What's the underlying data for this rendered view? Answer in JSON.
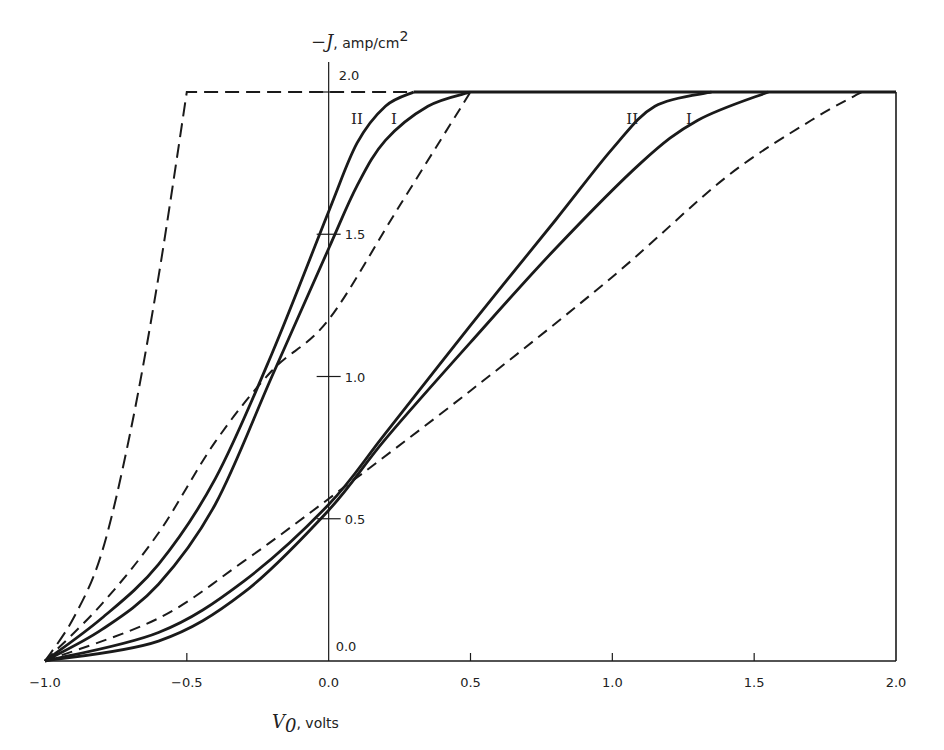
{
  "chart_data": {
    "type": "line",
    "title": "",
    "xlabel": "V0, volts",
    "ylabel": "-J, amp/cm2",
    "xlim": [
      -1.0,
      2.0
    ],
    "ylim": [
      0.0,
      2.0
    ],
    "grid": false,
    "legend": "none (curves labeled inline with I and II)",
    "x_ticks": [
      -1.0,
      -0.5,
      0.0,
      0.5,
      1.0,
      1.5,
      2.0
    ],
    "x_tick_labels": [
      "−1.0",
      "−0.5",
      "0.0",
      "0.5",
      "1.0",
      "1.5",
      "2.0"
    ],
    "y_ticks": [
      0.0,
      0.5,
      1.0,
      1.5,
      2.0
    ],
    "y_tick_labels": [
      "0.0",
      "0.5",
      "1.0",
      "1.5",
      "2.0"
    ],
    "saturation_level": 2.0,
    "series": [
      {
        "name": "left dashed (steep)",
        "style": "dashed",
        "group": "left",
        "x": [
          -1.0,
          -0.9,
          -0.8,
          -0.7,
          -0.6,
          -0.5,
          0.3
        ],
        "y": [
          0.0,
          0.15,
          0.38,
          0.8,
          1.35,
          2.0,
          2.0
        ]
      },
      {
        "name": "left dashed (linear)",
        "style": "dashed",
        "group": "left",
        "x": [
          -1.0,
          -0.8,
          -0.6,
          -0.4,
          -0.2,
          0.0,
          0.25,
          0.5
        ],
        "y": [
          0.0,
          0.2,
          0.45,
          0.77,
          1.02,
          1.2,
          1.6,
          2.0
        ]
      },
      {
        "name": "II",
        "style": "solid",
        "group": "left",
        "x": [
          -1.0,
          -0.8,
          -0.6,
          -0.4,
          -0.2,
          0.0,
          0.1,
          0.2,
          0.3
        ],
        "y": [
          0.0,
          0.15,
          0.34,
          0.64,
          1.08,
          1.58,
          1.82,
          1.95,
          2.0
        ]
      },
      {
        "name": "I",
        "style": "solid",
        "group": "left",
        "x": [
          -1.0,
          -0.8,
          -0.6,
          -0.4,
          -0.2,
          0.0,
          0.1,
          0.2,
          0.35,
          0.5
        ],
        "y": [
          0.0,
          0.11,
          0.27,
          0.55,
          1.0,
          1.45,
          1.67,
          1.83,
          1.95,
          2.0
        ]
      },
      {
        "name": "II",
        "style": "solid",
        "group": "right",
        "x": [
          -1.0,
          -0.6,
          -0.3,
          0.0,
          0.2,
          0.5,
          0.8,
          1.0,
          1.15,
          1.35
        ],
        "y": [
          0.0,
          0.1,
          0.28,
          0.55,
          0.8,
          1.18,
          1.55,
          1.8,
          1.95,
          2.0
        ]
      },
      {
        "name": "I",
        "style": "solid",
        "group": "right",
        "x": [
          -1.0,
          -0.6,
          -0.3,
          0.0,
          0.2,
          0.5,
          0.8,
          1.1,
          1.3,
          1.55
        ],
        "y": [
          0.0,
          0.07,
          0.24,
          0.53,
          0.78,
          1.12,
          1.45,
          1.75,
          1.9,
          2.0
        ]
      },
      {
        "name": "right dashed",
        "style": "dashed",
        "group": "right",
        "x": [
          -1.0,
          -0.6,
          -0.3,
          0.0,
          0.5,
          1.0,
          1.4,
          1.7,
          1.88
        ],
        "y": [
          0.0,
          0.15,
          0.35,
          0.57,
          0.95,
          1.35,
          1.7,
          1.9,
          2.0
        ]
      }
    ],
    "annotations": [
      {
        "text": "II",
        "x": 0.1,
        "y": 1.9
      },
      {
        "text": "I",
        "x": 0.23,
        "y": 1.9
      },
      {
        "text": "II",
        "x": 1.07,
        "y": 1.9
      },
      {
        "text": "I",
        "x": 1.27,
        "y": 1.9
      }
    ]
  },
  "labels": {
    "y_axis_title_prefix": "−J",
    "y_axis_title_suffix": ", amp/cm",
    "y_axis_title_sup": "2",
    "x_axis_title_var": "V",
    "x_axis_title_sub": "0",
    "x_axis_title_suffix": ", volts"
  },
  "colors": {
    "ink": "#1a1a1a",
    "background": "#ffffff"
  }
}
